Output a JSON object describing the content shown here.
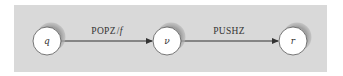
{
  "diagram": {
    "type": "state-transition",
    "background_color": "#d9d9d9",
    "node_fill": "#ffffff",
    "shadow_color": "#9a9a9a",
    "edge_color": "#333333",
    "nodes": [
      {
        "id": "q",
        "label": "q"
      },
      {
        "id": "nu",
        "label": "ν"
      },
      {
        "id": "r",
        "label": "r"
      }
    ],
    "edges": [
      {
        "from": "q",
        "to": "nu",
        "label_main": "POPZ",
        "label_sep": "/",
        "label_italic": "f"
      },
      {
        "from": "nu",
        "to": "r",
        "label_main": "PUSHZ"
      }
    ]
  }
}
